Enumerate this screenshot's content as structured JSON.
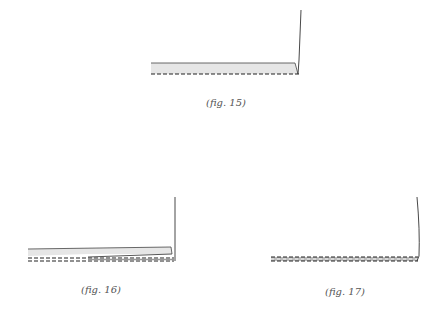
{
  "figures": [
    {
      "id": "fig-15",
      "caption": "(fig. 15)",
      "description": "single flat panel with dashed bottom edge and vertical line"
    },
    {
      "id": "fig-16",
      "caption": "(fig. 16)",
      "description": "tapered panel lifting over double dashed strip with vertical line"
    },
    {
      "id": "fig-17",
      "caption": "(fig. 17)",
      "description": "flattened double dashed strip with vertical line"
    }
  ],
  "colors": {
    "line": "#333333",
    "panel_fill": "#e6e6e6",
    "dash": "#222222",
    "background": "#ffffff"
  }
}
